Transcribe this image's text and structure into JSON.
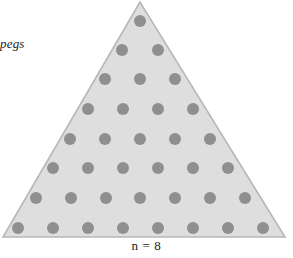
{
  "figure": {
    "side_label": "of pegs",
    "caption": "n = 8",
    "colors": {
      "triangle_fill": "#dedede",
      "triangle_stroke": "#b8b8b8",
      "peg_fill": "#8f8f8f",
      "background": "#ffffff",
      "text": "#1a1a1a"
    }
  },
  "chart_data": {
    "type": "scatter",
    "title": "",
    "subtitle": "",
    "xlabel": "n = 8",
    "ylabel": "of pegs",
    "annotations": [
      "of pegs",
      "n = 8"
    ],
    "grid": false,
    "legend": null,
    "n": 8,
    "total_pegs": 36,
    "row_counts": [
      1,
      2,
      3,
      4,
      5,
      6,
      7,
      8
    ],
    "triangle_vertices": [
      [
        140,
        2
      ],
      [
        3,
        237
      ],
      [
        285,
        237
      ]
    ],
    "peg_radius": 6,
    "rows": [
      {
        "row": 1,
        "count": 1,
        "y": 21,
        "x": [
          140
        ]
      },
      {
        "row": 2,
        "count": 2,
        "y": 50,
        "x": [
          122,
          158
        ]
      },
      {
        "row": 3,
        "count": 3,
        "y": 79,
        "x": [
          105,
          140,
          175
        ]
      },
      {
        "row": 4,
        "count": 4,
        "y": 109,
        "x": [
          88,
          123,
          158,
          193
        ]
      },
      {
        "row": 5,
        "count": 5,
        "y": 139,
        "x": [
          70,
          105,
          140,
          175,
          210
        ]
      },
      {
        "row": 6,
        "count": 6,
        "y": 168,
        "x": [
          53,
          88,
          123,
          158,
          193,
          228
        ]
      },
      {
        "row": 7,
        "count": 7,
        "y": 198,
        "x": [
          36,
          71,
          106,
          140,
          175,
          210,
          245
        ]
      },
      {
        "row": 8,
        "count": 8,
        "y": 228,
        "x": [
          18,
          53,
          88,
          123,
          158,
          193,
          228,
          263
        ]
      }
    ]
  }
}
